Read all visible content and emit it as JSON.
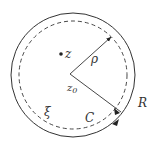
{
  "diagram": {
    "labels": {
      "z": "z",
      "rho": "ρ",
      "z0": "z",
      "z0_sub": "0",
      "xi": "ξ",
      "C": "C",
      "R": "R"
    },
    "colors": {
      "stroke": "#333333",
      "background": "#ffffff"
    },
    "geometry": {
      "center": [
        70,
        74
      ],
      "outer_radius": 62,
      "dashed_radius": 54
    }
  }
}
